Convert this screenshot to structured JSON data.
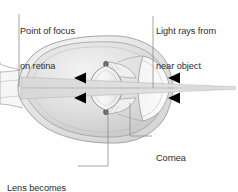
{
  "figure": {
    "type": "anatomical-diagram",
    "width": 238,
    "height": 192,
    "background_color": "#ffffff",
    "line_color": "#9a9a9a",
    "text_color": "#2b2b2b",
    "arrow_color": "#000000",
    "sclera_fill": "#e8e8e8",
    "vitreous_fill": "#dcdcdc"
  },
  "labels": {
    "point_of_focus": {
      "line1": "Point of focus",
      "line2": "on retina",
      "full": "Point of focus on retina"
    },
    "light_rays": {
      "line1": "Light rays from",
      "line2": "near object",
      "full": "Light rays from near object"
    },
    "cornea": {
      "line1": "Cornea",
      "full": "Cornea"
    },
    "lens_rounder": {
      "line1": "Lens becomes",
      "line2": "rounder",
      "full": "Lens becomes rounder"
    }
  },
  "annotations": {
    "arrowheads": [
      {
        "name": "ray-arrow-inner-upper",
        "x": 82,
        "y": 78,
        "direction": "left"
      },
      {
        "name": "ray-arrow-inner-lower",
        "x": 82,
        "y": 98,
        "direction": "left"
      },
      {
        "name": "ray-arrow-outer-upper",
        "x": 176,
        "y": 78,
        "direction": "left"
      },
      {
        "name": "ray-arrow-outer-lower",
        "x": 176,
        "y": 98,
        "direction": "left"
      }
    ],
    "focus_point": {
      "x": 21,
      "y": 88
    },
    "object_point": {
      "x": 236,
      "y": 88
    }
  },
  "leaders": {
    "point_of_focus": "vertical line from text down to retina focus point",
    "light_rays": "vertical line from text down to ray bundle",
    "cornea": "elbow line from corneal surface down and right to text",
    "lens_rounder": "elbow line from lens down and left to text"
  }
}
